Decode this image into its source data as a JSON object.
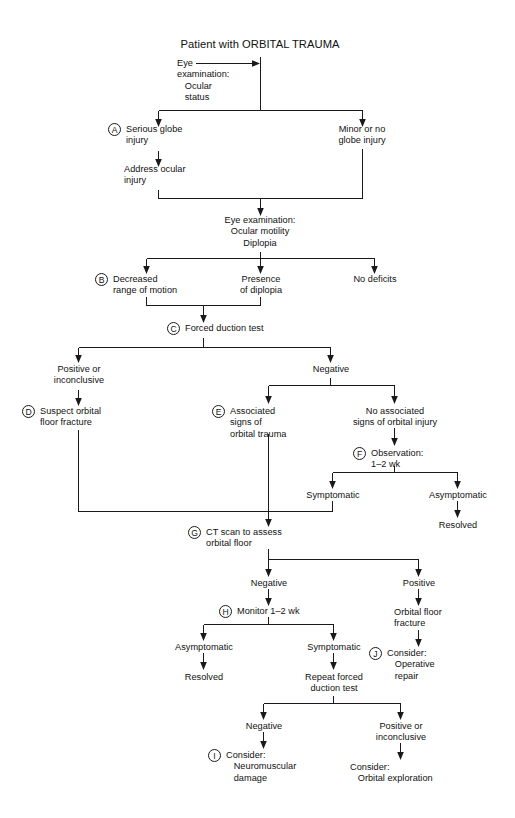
{
  "figure": {
    "title": "Patient with ORBITAL TRAUMA",
    "type": "clinical-algorithm-flowchart",
    "background_color": "#ffffff",
    "line_color": "#1a1a1a",
    "text_color": "#111111"
  },
  "key_letters": [
    "A",
    "B",
    "C",
    "D",
    "E",
    "F",
    "G",
    "H",
    "I",
    "J"
  ],
  "nodes": {
    "eye_exam_1": "Eye\nexamination:\n   Ocular\n   status",
    "serious_globe": "Serious globe\ninjury",
    "minor_globe": "Minor or no\nglobe injury",
    "address_ocular": "Address ocular\ninjury",
    "eye_exam_2": "Eye examination:\nOcular motility\nDiplopia",
    "decreased_rom": "Decreased\nrange of motion",
    "presence_diplopia": "Presence\nof diplopia",
    "no_deficits": "No deficits",
    "forced_duction": "Forced duction test",
    "positive_inconclusive_1": "Positive or\ninconclusive",
    "negative_1": "Negative",
    "suspect_fracture": "Suspect orbital\nfloor fracture",
    "associated_signs": "Associated\nsigns of\norbital trauma",
    "no_associated_signs": "No associated\nsigns of orbital injury",
    "observation": "Observation:\n1–2 wk",
    "symptomatic_1": "Symptomatic",
    "asymptomatic_1": "Asymptomatic",
    "resolved_1": "Resolved",
    "ct_scan": "CT scan to assess\norbital floor",
    "negative_2": "Negative",
    "positive_2": "Positive",
    "orbital_floor_fracture": "Orbital floor\nfracture",
    "consider_operative": "Consider:\n   Operative\n   repair",
    "monitor": "Monitor 1–2 wk",
    "asymptomatic_2": "Asymptomatic",
    "symptomatic_2": "Symptomatic",
    "resolved_2": "Resolved",
    "repeat_forced_duction": "Repeat forced\nduction test",
    "negative_3": "Negative",
    "positive_inconclusive_3": "Positive or\ninconclusive",
    "consider_neuromuscular": "Consider:\n   Neuromuscular\n   damage",
    "consider_exploration": "Consider:\n   Orbital exploration"
  }
}
